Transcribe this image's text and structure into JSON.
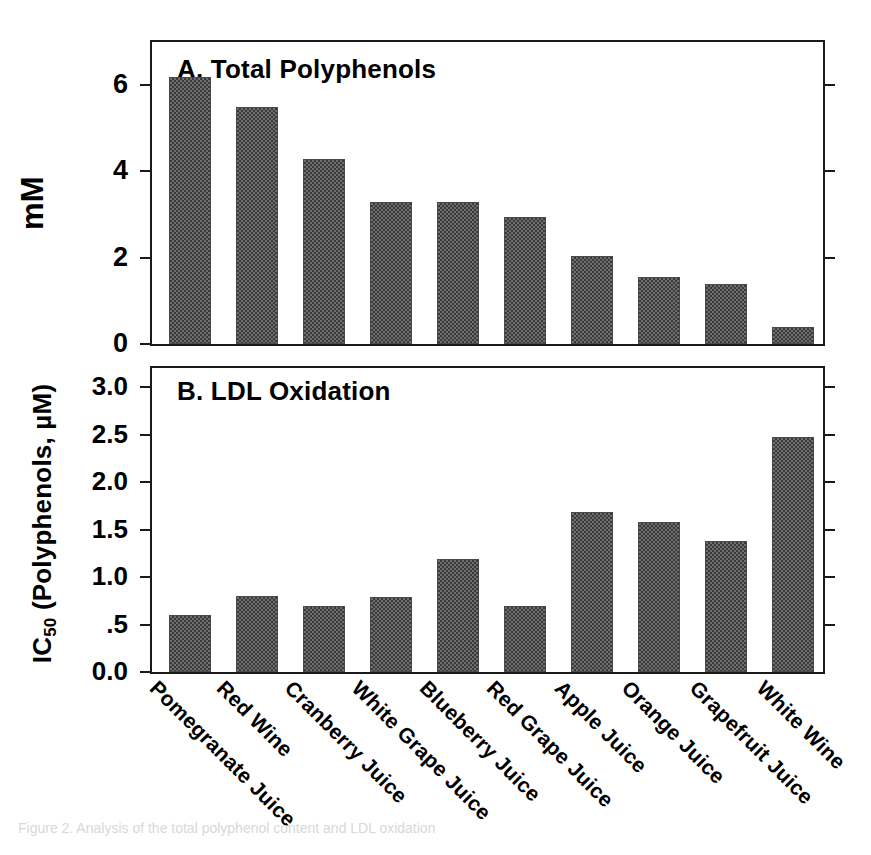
{
  "figure": {
    "caption_faint": "Figure 2.  Analysis of the total polyphenol content and LDL oxidation"
  },
  "panel_a": {
    "title": "A. Total Polyphenols",
    "ylabel": "mM",
    "yticks": [
      "0",
      "2",
      "4",
      "6"
    ],
    "ytick_values": [
      0,
      2,
      4,
      6
    ]
  },
  "panel_b": {
    "title": "B. LDL Oxidation",
    "ylabel_main": "IC",
    "ylabel_sub": "50",
    "ylabel_rest": " (Polyphenols, µM)",
    "yticks": [
      "0.0",
      ".5",
      "1.0",
      "1.5",
      "2.0",
      "2.5",
      "3.0"
    ],
    "ytick_values": [
      0.0,
      0.5,
      1.0,
      1.5,
      2.0,
      2.5,
      3.0
    ]
  },
  "categories": [
    "Pomegranate Juice",
    "Red Wine",
    "Cranberry Juice",
    "White Grape Juice",
    "Blueberry Juice",
    "Red Grape Juice",
    "Apple Juice",
    "Orange Juice",
    "Grapefruit Juice",
    "White Wine"
  ],
  "chart_data": [
    {
      "type": "bar",
      "title": "A. Total Polyphenols",
      "xlabel": "",
      "ylabel": "mM",
      "ylim": [
        0,
        7
      ],
      "yticks": [
        0,
        2,
        4,
        6
      ],
      "grid": false,
      "legend": "none",
      "categories": [
        "Pomegranate Juice",
        "Red Wine",
        "Cranberry Juice",
        "White Grape Juice",
        "Blueberry Juice",
        "Red Grape Juice",
        "Apple Juice",
        "Orange Juice",
        "Grapefruit Juice",
        "White Wine"
      ],
      "values": [
        6.2,
        5.5,
        4.3,
        3.3,
        3.3,
        2.95,
        2.05,
        1.55,
        1.4,
        0.4
      ]
    },
    {
      "type": "bar",
      "title": "B. LDL Oxidation",
      "xlabel": "",
      "ylabel": "IC50 (Polyphenols, µM)",
      "ylim": [
        0.0,
        3.2
      ],
      "yticks": [
        0.0,
        0.5,
        1.0,
        1.5,
        2.0,
        2.5,
        3.0
      ],
      "grid": false,
      "legend": "none",
      "categories": [
        "Pomegranate Juice",
        "Red Wine",
        "Cranberry Juice",
        "White Grape Juice",
        "Blueberry Juice",
        "Red Grape Juice",
        "Apple Juice",
        "Orange Juice",
        "Grapefruit Juice",
        "White Wine"
      ],
      "values": [
        0.6,
        0.8,
        0.7,
        0.79,
        1.19,
        0.69,
        1.68,
        1.58,
        1.38,
        2.47
      ]
    }
  ],
  "colors": {
    "bar_fill": "#6e6e6e",
    "bar_pattern": "#3a3a3a",
    "axis": "#1a1a1a",
    "text": "#000000"
  }
}
